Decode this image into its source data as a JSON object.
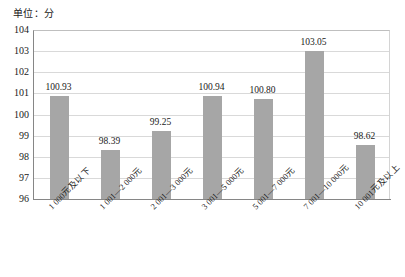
{
  "chart_data": {
    "type": "bar",
    "title": "单位：分",
    "xlabel": "",
    "ylabel": "",
    "ylim": [
      96,
      104
    ],
    "yticks": [
      104,
      103,
      102,
      101,
      100,
      99,
      98,
      97,
      96
    ],
    "grid": true,
    "legend": false,
    "bar_color": "#a6a6a6",
    "categories": [
      "1 000元及以下",
      "1 001—2 000元",
      "2 001—3 000元",
      "3 001—5 000元",
      "5 001—7 000元",
      "7 001—10 000元",
      "10 001元及以上"
    ],
    "values": [
      100.93,
      98.39,
      99.25,
      100.94,
      100.8,
      103.05,
      98.62
    ],
    "value_labels": [
      "100.93",
      "98.39",
      "99.25",
      "100.94",
      "100.80",
      "103.05",
      "98.62"
    ]
  }
}
